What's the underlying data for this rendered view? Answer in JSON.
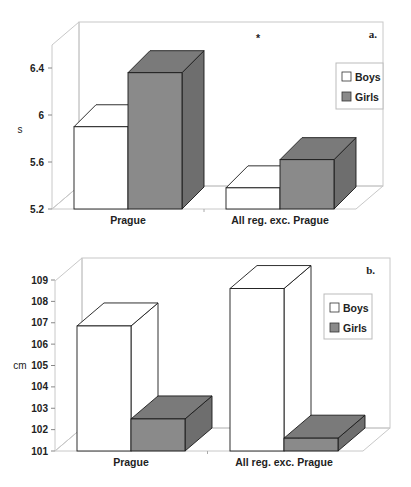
{
  "colors": {
    "boys": "#ffffff",
    "girls": "#8a8a8a",
    "girls_top": "#7a7a7a",
    "girls_side": "#6e6e6e",
    "grid": "#c8c8c8",
    "outline": "#1a1a1a"
  },
  "chart_data": [
    {
      "type": "bar",
      "style": "3d-clustered-column",
      "panel_label": "a.",
      "annotation": "*",
      "title": "",
      "xlabel": "",
      "ylabel": "s",
      "ylim": [
        5.2,
        6.6
      ],
      "yticks": [
        "5.2",
        "5.6",
        "6",
        "6.4"
      ],
      "categories": [
        "Prague",
        "All reg. exc. Prague"
      ],
      "series": [
        {
          "name": "Boys",
          "values": [
            5.9,
            5.38
          ]
        },
        {
          "name": "Girls",
          "values": [
            6.36,
            5.62
          ]
        }
      ],
      "legend": {
        "position": "upper-right-inside",
        "entries": [
          "Boys",
          "Girls"
        ]
      },
      "grid": false
    },
    {
      "type": "bar",
      "style": "3d-clustered-column",
      "panel_label": "b.",
      "title": "",
      "xlabel": "",
      "ylabel": "cm",
      "ylim": [
        101,
        109
      ],
      "yticks": [
        "101",
        "102",
        "103",
        "104",
        "105",
        "106",
        "107",
        "108",
        "109"
      ],
      "categories": [
        "Prague",
        "All reg. exc. Prague"
      ],
      "series": [
        {
          "name": "Boys",
          "values": [
            106.85,
            108.6
          ]
        },
        {
          "name": "Girls",
          "values": [
            102.5,
            101.6
          ]
        }
      ],
      "legend": {
        "position": "upper-right-inside",
        "entries": [
          "Boys",
          "Girls"
        ]
      },
      "grid": false
    }
  ]
}
